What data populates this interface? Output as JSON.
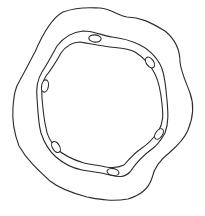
{
  "figure": {
    "subject": "stem cross-section line drawing",
    "stroke_color": "#2b2b2b",
    "background_color": "#ffffff",
    "layers": [
      {
        "name": "outer-cortex-boundary"
      },
      {
        "name": "vascular-ring-outer-boundary"
      },
      {
        "name": "vascular-ring-inner-boundary"
      }
    ],
    "vascular_bundle_count": 6,
    "bundles": [
      {
        "cx": 95,
        "cy": 38,
        "rx": 6,
        "ry": 3.5,
        "rotate": 5
      },
      {
        "cx": 150,
        "cy": 63,
        "rx": 6,
        "ry": 3.5,
        "rotate": 55
      },
      {
        "cx": 45,
        "cy": 86,
        "rx": 6,
        "ry": 3.5,
        "rotate": 100
      },
      {
        "cx": 159,
        "cy": 134,
        "rx": 6,
        "ry": 3.5,
        "rotate": 125
      },
      {
        "cx": 56,
        "cy": 147,
        "rx": 6,
        "ry": 3.5,
        "rotate": 60
      },
      {
        "cx": 113,
        "cy": 172,
        "rx": 6,
        "ry": 3.5,
        "rotate": 10
      }
    ]
  }
}
